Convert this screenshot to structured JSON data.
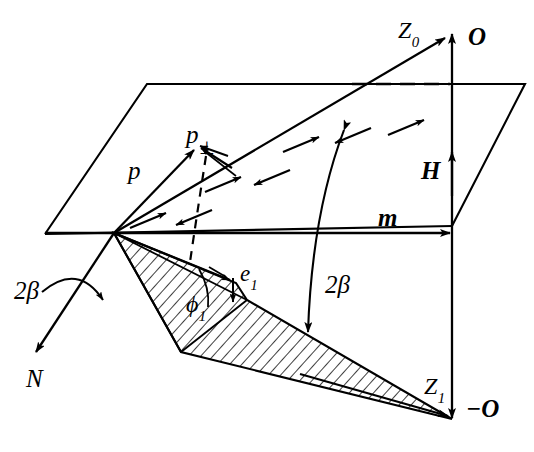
{
  "figure": {
    "background_color": "#ffffff",
    "stroke_color": "#000000",
    "width": 534,
    "height": 452
  },
  "labels": {
    "p": {
      "text": "p",
      "style": "italic",
      "x": 128,
      "y": 158,
      "size": 25
    },
    "p_perp_base": {
      "text": "p",
      "style": "italic",
      "x": 186,
      "y": 122,
      "size": 25
    },
    "p_perp_sub": {
      "text": "⊥"
    },
    "z0_base": {
      "text": "Z",
      "style": "italic",
      "x": 398,
      "y": 18,
      "size": 24
    },
    "z0_sub": {
      "text": "0"
    },
    "z1_base": {
      "text": "Z",
      "style": "italic",
      "x": 424,
      "y": 374,
      "size": 24
    },
    "z1_sub": {
      "text": "1"
    },
    "e1_base": {
      "text": "e",
      "style": "italic",
      "x": 232,
      "y": 260,
      "size": 23
    },
    "e1_sub": {
      "text": "1"
    },
    "phi1_base": {
      "text": "ϕ",
      "style": "italic",
      "x": 186,
      "y": 295,
      "size": 24
    },
    "phi1_sub": {
      "text": "1"
    },
    "O_top": {
      "text": "O",
      "style": "bolditalic",
      "x": 466,
      "y": 24,
      "size": 25
    },
    "O_bottom": {
      "text": "−O",
      "style": "bolditalic",
      "x": 466,
      "y": 398,
      "size": 25
    },
    "H": {
      "text": "H",
      "style": "bolditalic",
      "x": 421,
      "y": 158,
      "size": 25
    },
    "m": {
      "text": "m",
      "style": "bolditalic",
      "x": 378,
      "y": 203,
      "size": 25
    },
    "N": {
      "text": "N",
      "style": "italic",
      "x": 26,
      "y": 368,
      "size": 25
    },
    "two_beta_center": {
      "text": "2β",
      "style": "italic",
      "x": 325,
      "y": 272,
      "size": 25
    },
    "two_beta_left": {
      "text": "2β",
      "style": "italic",
      "x": 14,
      "y": 280,
      "size": 25
    }
  },
  "geometry": {
    "origin": {
      "x": 114,
      "y": 233
    },
    "plane": {
      "name": "horizontal-plane-parallelogram",
      "points": "45,234 147,84 525,84 452,226"
    },
    "axes": {
      "m_axis": {
        "x1": 45,
        "y1": 233,
        "x2": 452,
        "y2": 233
      },
      "O_axis_up": {
        "x1": 452,
        "y1": 226,
        "x2": 452,
        "y2": 32
      },
      "O_axis_down": {
        "x1": 452,
        "y1": 233,
        "x2": 452,
        "y2": 420
      },
      "dashed_plane_edge": {
        "x1": 350,
        "y1": 84,
        "x2": 452,
        "y2": 84
      }
    },
    "vectors": {
      "z0": {
        "x1": 114,
        "y1": 233,
        "x2": 447,
        "y2": 36
      },
      "p": {
        "x1": 114,
        "y1": 233,
        "x2": 196,
        "y2": 148
      },
      "n": {
        "x1": 114,
        "y1": 233,
        "x2": 35,
        "y2": 355
      },
      "e1": {
        "x1": 114,
        "y1": 233,
        "x2": 232,
        "y2": 281
      }
    },
    "wedge": {
      "name": "hatched-cone-Z1",
      "points": "114,233 232,281 245,299 182,352 452,420",
      "hatch_angle": 45
    }
  },
  "field_arrows": [
    {
      "x1": 130,
      "y1": 228,
      "x2": 168,
      "y2": 212,
      "dir": "right"
    },
    {
      "x1": 214,
      "y1": 212,
      "x2": 176,
      "y2": 226,
      "dir": "left"
    },
    {
      "x1": 205,
      "y1": 192,
      "x2": 243,
      "y2": 176,
      "dir": "right"
    },
    {
      "x1": 292,
      "y1": 172,
      "x2": 254,
      "y2": 186,
      "dir": "left"
    },
    {
      "x1": 283,
      "y1": 152,
      "x2": 321,
      "y2": 136,
      "dir": "right"
    },
    {
      "x1": 372,
      "y1": 130,
      "x2": 334,
      "y2": 144,
      "dir": "left"
    },
    {
      "x1": 360,
      "y1": 138,
      "x2": 398,
      "y2": 122,
      "dir": "right"
    },
    {
      "x1": 208,
      "y1": 158,
      "x2": 232,
      "y2": 149,
      "dir": "right"
    }
  ],
  "arcs": {
    "two_beta_center_arc": "M 347,128 Q 316,210 309,330",
    "two_beta_left_arc": "M 42,288 Q 82,268 106,306",
    "phi1_arc": "M 196,271 Q 206,289 204,308",
    "p_perp_arc": "M 205,158 Q 196,212 190,258",
    "p_tip_arc": "M 200,152 Q 220,160 232,172"
  }
}
